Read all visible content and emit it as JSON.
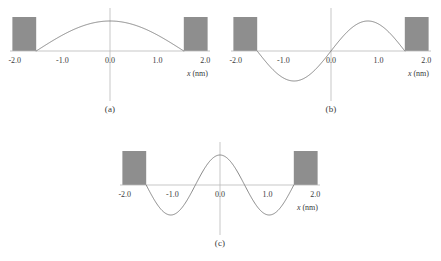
{
  "figure": {
    "title": "",
    "background_color": "#ffffff",
    "barrier_color": "#8e8e8e",
    "curve_color": "#7a7a7a",
    "axis_color": "#b9b9b9"
  },
  "axis": {
    "xlabel_italic": "x",
    "xlabel_unit": " (nm)",
    "xlabel_full": "x (nm)",
    "tick_labels": [
      "-2.0",
      "-1.0",
      "0.0",
      "1.0",
      "2.0"
    ],
    "tick_values": [
      -2.0,
      -1.0,
      0.0,
      1.0,
      2.0
    ],
    "xlim": [
      -2.1,
      2.1
    ]
  },
  "well": {
    "left_edge_nm": -1.55,
    "right_edge_nm": 1.55,
    "barrier_outer_left_nm": -2.05,
    "barrier_outer_right_nm": 2.05,
    "barrier_height": 1.0
  },
  "panels": [
    {
      "id": "a",
      "caption": "(a)",
      "quantum_number": 1,
      "nodes_inside": 0,
      "description": "ground state, single half-wavelength, positive lobe"
    },
    {
      "id": "b",
      "caption": "(b)",
      "quantum_number": 2,
      "nodes_inside": 1,
      "description": "first excited state, one full wavelength, negative then positive lobe"
    },
    {
      "id": "c",
      "caption": "(c)",
      "quantum_number": 3,
      "nodes_inside": 2,
      "description": "second excited state, central positive lobe with two negative lobes"
    }
  ],
  "chart_data": {
    "type": "line",
    "title": "",
    "xlabel": "x (nm)",
    "ylabel": "",
    "xlim": [
      -2.1,
      2.1
    ],
    "grid": false,
    "legend": "none",
    "xticks": [
      -2.0,
      -1.0,
      0.0,
      1.0,
      2.0
    ],
    "xticklabels": [
      "-2.0",
      "-1.0",
      "0.0",
      "1.0",
      "2.0"
    ],
    "subplots": [
      {
        "label": "(a)",
        "n": 1,
        "function": "A*cos(pi*x/(2*L)) for |x|<L, L=1.55 nm",
        "ylim": [
          -1.15,
          1.15
        ],
        "x": [
          -1.55,
          -1.4,
          -1.2,
          -1.0,
          -0.8,
          -0.6,
          -0.4,
          -0.2,
          0.0,
          0.2,
          0.4,
          0.6,
          0.8,
          1.0,
          1.2,
          1.4,
          1.55
        ],
        "y": [
          0.0,
          0.151,
          0.348,
          0.527,
          0.685,
          0.815,
          0.913,
          0.975,
          1.0,
          0.975,
          0.913,
          0.815,
          0.685,
          0.527,
          0.348,
          0.151,
          0.0
        ],
        "barriers": [
          {
            "x0": -2.05,
            "x1": -1.55,
            "height": 1.0
          },
          {
            "x0": 1.55,
            "x1": 2.05,
            "height": 1.0
          }
        ]
      },
      {
        "label": "(b)",
        "n": 2,
        "function": "A*sin(pi*x/L) for |x|<L, L=1.55 nm",
        "ylim": [
          -1.15,
          1.15
        ],
        "x": [
          -1.55,
          -1.4,
          -1.2,
          -1.0,
          -0.8,
          -0.6,
          -0.4,
          -0.2,
          0.0,
          0.2,
          0.4,
          0.6,
          0.8,
          1.0,
          1.2,
          1.4,
          1.55
        ],
        "y": [
          0.0,
          -0.298,
          -0.653,
          -0.895,
          -0.996,
          -0.937,
          -0.73,
          -0.398,
          0.0,
          0.398,
          0.73,
          0.937,
          0.996,
          0.895,
          0.653,
          0.298,
          0.0
        ],
        "barriers": [
          {
            "x0": -2.05,
            "x1": -1.55,
            "height": 1.0
          },
          {
            "x0": 1.55,
            "x1": 2.05,
            "height": 1.0
          }
        ]
      },
      {
        "label": "(c)",
        "n": 3,
        "function": "A*cos(3*pi*x/(2*L)) for |x|<L, L=1.55 nm",
        "ylim": [
          -1.15,
          1.15
        ],
        "x": [
          -1.55,
          -1.4,
          -1.2,
          -1.0,
          -0.8,
          -0.6,
          -0.4,
          -0.2,
          0.0,
          0.2,
          0.4,
          0.6,
          0.8,
          1.0,
          1.2,
          1.4,
          1.55
        ],
        "y": [
          0.0,
          -0.434,
          -0.844,
          -0.994,
          -0.844,
          -0.434,
          0.105,
          0.614,
          1.0,
          0.614,
          0.105,
          -0.434,
          -0.844,
          -0.994,
          -0.844,
          -0.434,
          0.0
        ],
        "barriers": [
          {
            "x0": -2.05,
            "x1": -1.55,
            "height": 1.0
          },
          {
            "x0": 1.55,
            "x1": 2.05,
            "height": 1.0
          }
        ]
      }
    ]
  }
}
